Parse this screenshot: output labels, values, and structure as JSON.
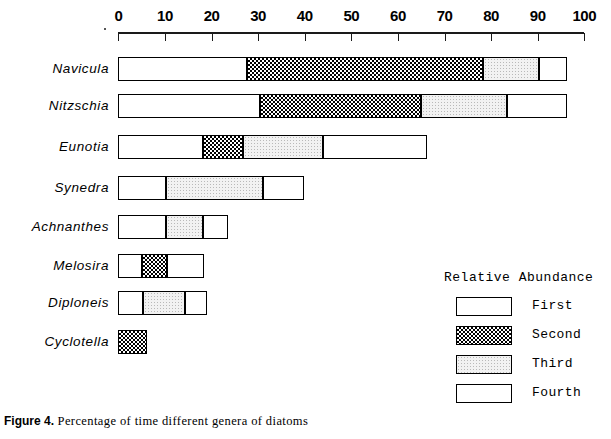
{
  "chart_data": {
    "type": "bar",
    "orientation": "horizontal",
    "subtype": "stacked-segment-range",
    "title": "",
    "xlabel": "",
    "ylabel": "",
    "xlim": [
      0,
      100
    ],
    "xticks": [
      0,
      10,
      20,
      30,
      40,
      50,
      60,
      70,
      80,
      90,
      100
    ],
    "xtick_labels": [
      "0",
      "10",
      "20",
      "30",
      "40",
      "50",
      "60",
      "70",
      "80",
      "90",
      "100"
    ],
    "grid": false,
    "legend_position": "bottom-right",
    "categories": [
      "Navicula",
      "Nitzschia",
      "Eunotia",
      "Synedra",
      "Achnanthes",
      "Melosira",
      "Diploneis",
      "Cyclotella"
    ],
    "legend": {
      "title": "Relative Abundance",
      "entries": [
        {
          "label": "First",
          "fill": "white"
        },
        {
          "label": "Second",
          "fill": "checker"
        },
        {
          "label": "Third",
          "fill": "gray"
        },
        {
          "label": "Fourth",
          "fill": "white"
        }
      ]
    },
    "series": [
      {
        "name": "Navicula",
        "total": 96.3,
        "segments": [
          {
            "abundance": "Fourth",
            "fill": "white",
            "start": 0,
            "end": 27.6,
            "width": 27.6
          },
          {
            "abundance": "Second",
            "fill": "checker",
            "start": 27.6,
            "end": 78.3,
            "width": 50.7
          },
          {
            "abundance": "Third",
            "fill": "gray",
            "start": 78.3,
            "end": 90.3,
            "width": 12.0
          },
          {
            "abundance": "First",
            "fill": "white",
            "start": 90.3,
            "end": 96.3,
            "width": 6.0
          }
        ]
      },
      {
        "name": "Nitzschia",
        "total": 96.3,
        "segments": [
          {
            "abundance": "Fourth",
            "fill": "white",
            "start": 0,
            "end": 30.4,
            "width": 30.4
          },
          {
            "abundance": "Second",
            "fill": "checker",
            "start": 30.4,
            "end": 65.0,
            "width": 34.6
          },
          {
            "abundance": "Third",
            "fill": "gray",
            "start": 65.0,
            "end": 83.4,
            "width": 18.4
          },
          {
            "abundance": "First",
            "fill": "white",
            "start": 83.4,
            "end": 96.3,
            "width": 12.9
          }
        ]
      },
      {
        "name": "Eunotia",
        "total": 66.2,
        "segments": [
          {
            "abundance": "Fourth",
            "fill": "white",
            "start": 0,
            "end": 18.2,
            "width": 18.2
          },
          {
            "abundance": "Second",
            "fill": "checker",
            "start": 18.2,
            "end": 26.8,
            "width": 8.6
          },
          {
            "abundance": "Third",
            "fill": "gray",
            "start": 26.8,
            "end": 44.0,
            "width": 17.2
          },
          {
            "abundance": "First",
            "fill": "white",
            "start": 44.0,
            "end": 66.2,
            "width": 22.2
          }
        ]
      },
      {
        "name": "Synedra",
        "total": 39.8,
        "segments": [
          {
            "abundance": "Fourth",
            "fill": "white",
            "start": 0,
            "end": 10.2,
            "width": 10.2
          },
          {
            "abundance": "Third",
            "fill": "gray",
            "start": 10.2,
            "end": 31.0,
            "width": 20.8
          },
          {
            "abundance": "First",
            "fill": "white",
            "start": 31.0,
            "end": 39.8,
            "width": 8.8
          }
        ]
      },
      {
        "name": "Achnanthes",
        "total": 23.5,
        "segments": [
          {
            "abundance": "Fourth",
            "fill": "white",
            "start": 0,
            "end": 10.2,
            "width": 10.2
          },
          {
            "abundance": "Third",
            "fill": "gray",
            "start": 10.2,
            "end": 18.2,
            "width": 8.0
          },
          {
            "abundance": "First",
            "fill": "white",
            "start": 18.2,
            "end": 23.5,
            "width": 5.3
          }
        ]
      },
      {
        "name": "Melosira",
        "total": 18.4,
        "segments": [
          {
            "abundance": "Fourth",
            "fill": "white",
            "start": 0,
            "end": 5.1,
            "width": 5.1
          },
          {
            "abundance": "Second",
            "fill": "checker",
            "start": 5.1,
            "end": 10.4,
            "width": 5.3
          },
          {
            "abundance": "First",
            "fill": "white",
            "start": 10.4,
            "end": 18.4,
            "width": 8.0
          }
        ]
      },
      {
        "name": "Diploneis",
        "total": 19.0,
        "segments": [
          {
            "abundance": "Fourth",
            "fill": "white",
            "start": 0,
            "end": 5.3,
            "width": 5.3
          },
          {
            "abundance": "Third",
            "fill": "gray",
            "start": 5.3,
            "end": 14.3,
            "width": 9.0
          },
          {
            "abundance": "First",
            "fill": "white",
            "start": 14.3,
            "end": 19.0,
            "width": 4.7
          }
        ]
      },
      {
        "name": "Cyclotella",
        "total": 6.2,
        "segments": [
          {
            "abundance": "Second",
            "fill": "checker",
            "start": 0,
            "end": 6.2,
            "width": 6.2
          }
        ]
      }
    ]
  },
  "caption": {
    "label": "Figure 4.",
    "text": " Percentage of time different genera of diatoms"
  },
  "colors": {
    "ink": "#000000",
    "fill_white": "#ffffff",
    "fill_gray": "#f0f0f0",
    "fill_checker": "#000000"
  }
}
